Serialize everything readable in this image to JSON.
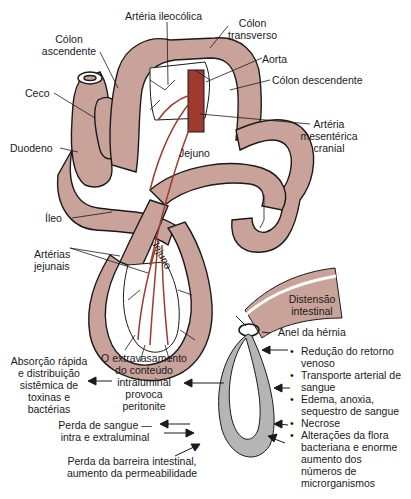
{
  "colors": {
    "intestine": "#c9a39a",
    "artery": "#9e3a2e",
    "loop_gray": "#b5b5b5",
    "outline": "#1a1a1a",
    "mesentery": "#ffffff"
  },
  "anatomy_labels": {
    "arteria_ileocolica": "Artéria ileocólica",
    "colon_transverso": [
      "Cólon",
      "transverso"
    ],
    "colon_ascendente": [
      "Cólon",
      "ascendente"
    ],
    "aorta": "Aorta",
    "ceco": "Ceco",
    "colon_descendente": "Cólon descendente",
    "arteria_mesenterica": [
      "Artéria",
      "mesentérica",
      "cranial"
    ],
    "duodeno": "Duodeno",
    "jejuno_upper": "Jejuno",
    "ileo": "Íleo",
    "jejuno_lower": "Jejuno",
    "arterias_jejunais": [
      "Artérias",
      "jejunais"
    ]
  },
  "hernia_diagram": {
    "distensao": [
      "Distensão",
      "intestinal"
    ],
    "anel": "Anel da hérnia",
    "consequences": [
      "Redução do retorno venoso",
      "Transporte arterial de sangue",
      "Edema, anoxia, sequestro de sangue",
      "Necrose",
      "Alterações da flora bacteriana e enorme aumento dos números de microrganismos"
    ],
    "consequence_lines": [
      [
        "Redução do retorno",
        "venoso"
      ],
      [
        "Transporte arterial de",
        "sangue"
      ],
      [
        "Edema, anoxia,",
        "sequestro de sangue"
      ],
      [
        "Necrose"
      ],
      [
        "Alterações da flora",
        "bacteriana e enorme",
        "aumento dos",
        "números de",
        "microrganismos"
      ]
    ],
    "extravasamento": [
      "O extravasamento",
      "do conteúdo",
      "intraluminal",
      "provoca",
      "peritonite"
    ],
    "absorcao": [
      "Absorção rápida",
      "e distribuição",
      "sistêmica de",
      "toxinas e",
      "bactérias"
    ],
    "perda_sangue": [
      "Perda de sangue —",
      "intra e extraluminal"
    ],
    "perda_barreira": [
      "Perda da barreira intestinal,",
      "aumento da permeabilidade"
    ]
  }
}
